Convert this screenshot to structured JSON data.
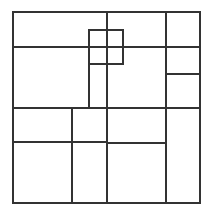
{
  "figure": {
    "type": "rectangle-subdivision",
    "stroke_color": "#333333",
    "background": "#ffffff",
    "outer_square": {
      "x1": 13,
      "y1": 12,
      "x2": 200,
      "y2": 203
    },
    "lines": [
      {
        "name": "h-top-band",
        "x1": 13,
        "y1": 47,
        "x2": 200,
        "y2": 47
      },
      {
        "name": "h-middle",
        "x1": 13,
        "y1": 108,
        "x2": 200,
        "y2": 108
      },
      {
        "name": "h-lower-left",
        "x1": 13,
        "y1": 142,
        "x2": 107,
        "y2": 142
      },
      {
        "name": "h-lower-center",
        "x1": 107,
        "y1": 143,
        "x2": 166,
        "y2": 143
      },
      {
        "name": "h-right-column",
        "x1": 166,
        "y1": 74,
        "x2": 200,
        "y2": 74
      },
      {
        "name": "v-center",
        "x1": 107,
        "y1": 12,
        "x2": 107,
        "y2": 203
      },
      {
        "name": "v-right-column",
        "x1": 166,
        "y1": 12,
        "x2": 166,
        "y2": 203
      },
      {
        "name": "v-lower-left",
        "x1": 72,
        "y1": 108,
        "x2": 72,
        "y2": 203
      },
      {
        "name": "v-small-stem",
        "x1": 89,
        "y1": 64,
        "x2": 89,
        "y2": 108
      }
    ],
    "small_square": {
      "x1": 89,
      "y1": 30,
      "x2": 123,
      "y2": 64
    }
  }
}
